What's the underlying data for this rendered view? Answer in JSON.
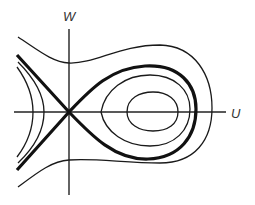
{
  "diagram": {
    "type": "phase-portrait",
    "axes": {
      "horizontal_label": "U",
      "vertical_label": "W"
    },
    "colors": {
      "stroke": "#1a1a1a",
      "axis": "#222222",
      "label": "#333333",
      "background": "#ffffff"
    },
    "features": {
      "saddle_point": "origin",
      "center_point": "right of origin on U axis",
      "separatrix": "homoclinic loop (thick)",
      "closed_orbits_inside_separatrix": 2,
      "outer_orbit_count": 1,
      "left_branch_curves": 2
    }
  }
}
